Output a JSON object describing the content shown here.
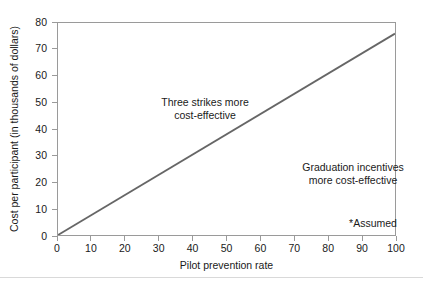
{
  "chart_data": {
    "type": "line",
    "title": "",
    "xlabel": "Pilot prevention rate",
    "ylabel": "Cost per participant  (in thousands of dollars)",
    "xlim": [
      0,
      100
    ],
    "ylim": [
      0,
      80
    ],
    "xticks": [
      "0",
      "10",
      "20",
      "30",
      "40",
      "50",
      "60",
      "70",
      "80",
      "90",
      "100"
    ],
    "yticks": [
      "0",
      "10",
      "20",
      "30",
      "40",
      "50",
      "60",
      "70",
      "80"
    ],
    "grid": false,
    "legend": null,
    "line_color": "#666666",
    "axis_color": "#9a9a9a",
    "series": [
      {
        "name": "Break-even cost",
        "x": [
          0,
          100
        ],
        "values": [
          0,
          76
        ]
      }
    ],
    "annotations": [
      {
        "id": "three-strikes",
        "lines": [
          "Three strikes more",
          "cost-effective"
        ],
        "x": 26,
        "y": 57
      },
      {
        "id": "graduation-incentives",
        "lines": [
          "Graduation incentives",
          "more cost-effective"
        ],
        "x": 69,
        "y": 33
      },
      {
        "id": "assumed-note",
        "lines": [
          "*Assumed"
        ],
        "x": 76,
        "y": 13
      }
    ]
  }
}
